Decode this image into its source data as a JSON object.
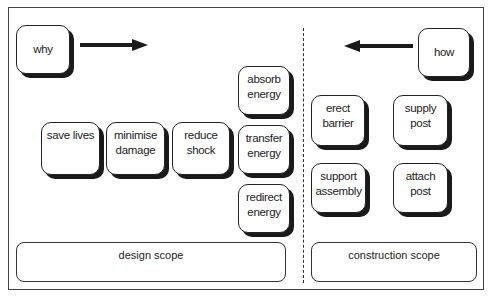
{
  "diagram": {
    "why": {
      "label": "why"
    },
    "how": {
      "label": "how"
    },
    "design_nodes": [
      {
        "lines": [
          "save lives"
        ]
      },
      {
        "lines": [
          "minimise",
          "damage"
        ]
      },
      {
        "lines": [
          "reduce",
          "shock"
        ]
      },
      {
        "lines": [
          "absorb",
          "energy"
        ]
      },
      {
        "lines": [
          "transfer",
          "energy"
        ]
      },
      {
        "lines": [
          "redirect",
          "energy"
        ]
      }
    ],
    "construction_nodes": [
      {
        "lines": [
          "erect",
          "barrier"
        ]
      },
      {
        "lines": [
          "supply",
          "post"
        ]
      },
      {
        "lines": [
          "support",
          "assembly"
        ]
      },
      {
        "lines": [
          "attach",
          "post"
        ]
      }
    ],
    "scopes": {
      "design": "design scope",
      "construction": "construction scope"
    },
    "arrows": {
      "why_direction": "right",
      "how_direction": "left"
    },
    "colors": {
      "stroke": "#222222",
      "shadow": "#1a1a1a",
      "background": "#ffffff"
    }
  }
}
